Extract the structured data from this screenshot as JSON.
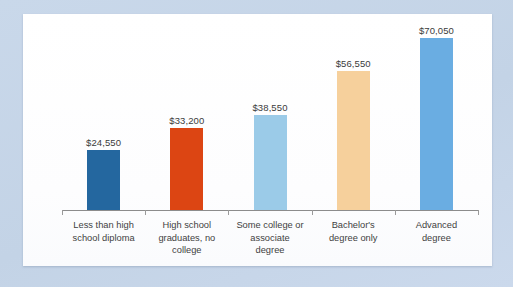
{
  "chart_data": {
    "type": "bar",
    "title": "",
    "subtitle": "",
    "xlabel": "",
    "ylabel": "",
    "ylim": [
      0,
      70050
    ],
    "grid": false,
    "legend": "none",
    "axis": {
      "baseline_visible": true,
      "tick_count": 6,
      "y_axis_visible": false,
      "y_ticks": []
    },
    "categories": [
      "Less than high school diploma",
      "High school graduates, no college",
      "Some college or associate degree",
      "Bachelor's degree only",
      "Advanced degree"
    ],
    "category_lines": [
      [
        "Less than high",
        "school diploma"
      ],
      [
        "High school",
        "graduates, no",
        "college"
      ],
      [
        "Some college or",
        "associate",
        "degree"
      ],
      [
        "Bachelor's",
        "degree only"
      ],
      [
        "Advanced",
        "degree"
      ]
    ],
    "values": [
      24550,
      33200,
      38550,
      56550,
      70050
    ],
    "data_labels": [
      "$24,550",
      "$33,200",
      "$38,550",
      "$56,550",
      "$70,050"
    ],
    "bar_colors": [
      "#24679f",
      "#dc4513",
      "#9bcbe8",
      "#f6d09c",
      "#6aade2"
    ]
  },
  "style": {
    "page_background": "#c7d7ea",
    "panel_background": "#ffffff",
    "axis_color": "#8c8c8c",
    "label_color": "#3f3f3f",
    "value_label_color": "#3b3b3b"
  }
}
